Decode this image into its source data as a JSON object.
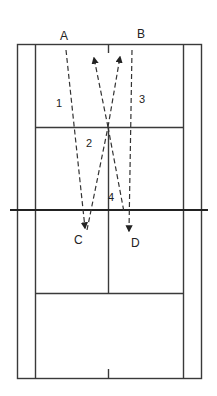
{
  "diagram": {
    "type": "badminton-court-drill",
    "players": [
      {
        "id": "A",
        "label": "A",
        "x": 66,
        "y": 40
      },
      {
        "id": "B",
        "label": "B",
        "x": 142,
        "y": 40
      },
      {
        "id": "C",
        "label": "C",
        "x": 78,
        "y": 243
      },
      {
        "id": "D",
        "label": "D",
        "x": 136,
        "y": 246
      }
    ],
    "shots": [
      {
        "number": "1",
        "label_x": 59,
        "label_y": 106,
        "from": "A",
        "to": "C"
      },
      {
        "number": "2",
        "label_x": 88,
        "label_y": 121,
        "from": "C",
        "to": "front-center"
      },
      {
        "number": "3",
        "label_x": 141,
        "label_y": 103,
        "from": "B",
        "to": "D"
      },
      {
        "number": "4",
        "label_x": 109,
        "label_y": 200,
        "from": "D",
        "to": "front-center"
      }
    ],
    "colors": {
      "lines": "#3a3a3a",
      "background": "#ffffff"
    }
  }
}
